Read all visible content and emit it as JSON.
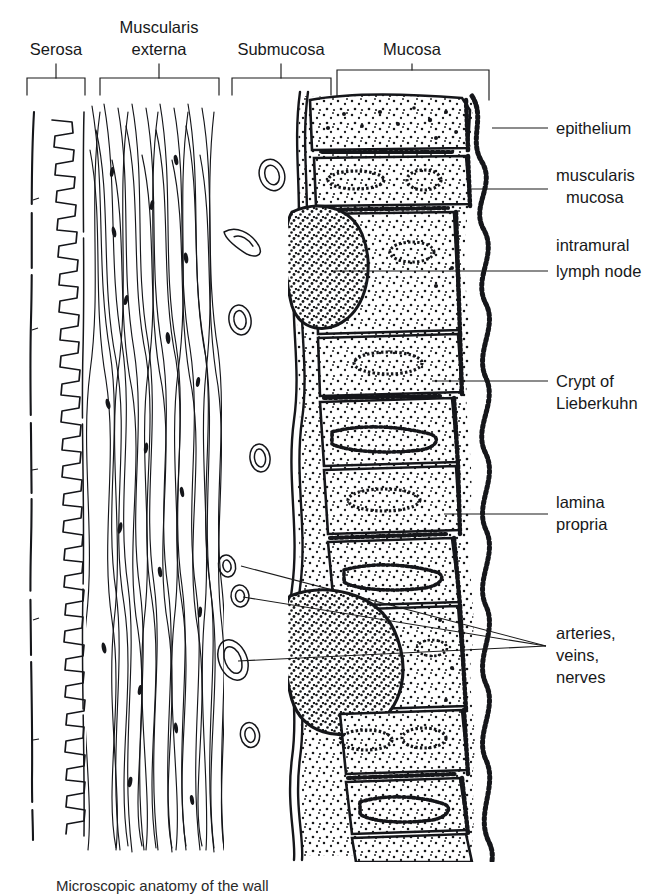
{
  "figure": {
    "background_color": "#ffffff",
    "ink_color": "#15161a",
    "width": 670,
    "height": 896
  },
  "top_brackets": [
    {
      "id": "serosa",
      "label": "Serosa",
      "label_lines": [
        "Serosa"
      ],
      "x_start": 27,
      "x_end": 85,
      "tick_x": 56,
      "bracket_y": 95,
      "stem_top_y": 68,
      "label_x": 56,
      "label_y": 55
    },
    {
      "id": "muscularis-externa",
      "label": "Muscularis externa",
      "label_lines": [
        "Muscularis",
        "externa"
      ],
      "x_start": 100,
      "x_end": 219,
      "tick_x": 159,
      "bracket_y": 95,
      "stem_top_y": 68,
      "label_x": 159,
      "label_y": 34
    },
    {
      "id": "submucosa",
      "label": "Submucosa",
      "label_lines": [
        "Submucosa"
      ],
      "x_start": 232,
      "x_end": 331,
      "tick_x": 281,
      "bracket_y": 95,
      "stem_top_y": 68,
      "label_x": 281,
      "label_y": 55
    },
    {
      "id": "mucosa",
      "label": "Mucosa",
      "label_lines": [
        "Mucosa"
      ],
      "x_start": 336,
      "x_end": 489,
      "tick_x": 412,
      "bracket_y": 82,
      "stem_top_y": 68,
      "label_x": 412,
      "label_y": 55
    }
  ],
  "side_labels": [
    {
      "id": "epithelium",
      "lines": [
        "epithelium"
      ],
      "text_x": 556,
      "first_line_y": 134,
      "line_height": 22,
      "leader": {
        "x1": 492,
        "y1": 128,
        "x2": 548,
        "y2": 128
      }
    },
    {
      "id": "muscularis-mucosa",
      "lines": [
        "muscularis",
        "mucosa"
      ],
      "text_x": 556,
      "first_line_y": 181,
      "line_height": 22,
      "leader": {
        "x1": 470,
        "y1": 189,
        "x2": 548,
        "y2": 189
      }
    },
    {
      "id": "intramural-lymph-node",
      "lines": [
        "intramural",
        "lymph node"
      ],
      "text_x": 556,
      "first_line_y": 251,
      "line_height": 22,
      "leader": {
        "x1": 332,
        "y1": 271,
        "x2": 548,
        "y2": 271
      }
    },
    {
      "id": "crypt-of-lieberkuhn",
      "lines": [
        "Crypt of",
        "Lieberkuhn"
      ],
      "text_x": 556,
      "first_line_y": 381,
      "line_height": 22,
      "leader": {
        "x1": 432,
        "y1": 381,
        "x2": 548,
        "y2": 381
      }
    },
    {
      "id": "lamina-propria",
      "lines": [
        "lamina",
        "propria"
      ],
      "text_x": 556,
      "first_line_y": 505,
      "line_height": 22,
      "leader": {
        "x1": 444,
        "y1": 514,
        "x2": 548,
        "y2": 514
      }
    },
    {
      "id": "arteries-veins-nerves",
      "lines": [
        "arteries,",
        "veins,",
        "nerves"
      ],
      "text_x": 556,
      "first_line_y": 633,
      "line_height": 22,
      "leader": null,
      "converge_point": {
        "x": 546,
        "y": 646
      },
      "leader_origins": [
        {
          "x": 241,
          "y": 566
        },
        {
          "x": 243,
          "y": 597
        },
        {
          "x": 238,
          "y": 661
        }
      ]
    }
  ],
  "caption": {
    "text": "Microscopic anatomy of the wall",
    "x": 56,
    "y": 888,
    "visible": "partial"
  },
  "layers": {
    "serosa": {
      "x_start": 27,
      "x_end": 88,
      "y_start": 104,
      "y_end": 840,
      "pattern": "wavy-squiggle"
    },
    "muscularis_externa": {
      "x_start": 88,
      "x_end": 222,
      "y_start": 104,
      "y_end": 850,
      "pattern": "long-muscle-fibers"
    },
    "submucosa": {
      "x_start": 222,
      "x_end": 290,
      "y_start": 104,
      "y_end": 850,
      "pattern": "open-with-vessels"
    },
    "mucosa": {
      "x_start": 290,
      "x_end": 500,
      "y_start": 88,
      "y_end": 858,
      "pattern": "stippled-villi-crypts"
    }
  },
  "vessels": [
    {
      "id": "vessel-1",
      "cx": 272,
      "cy": 175,
      "rx": 11,
      "ry": 15,
      "rot": -18,
      "shape": "oval-ring"
    },
    {
      "id": "vessel-2",
      "cx": 243,
      "cy": 238,
      "rx": 8,
      "ry": 20,
      "rot": -35,
      "shape": "elongated-ring"
    },
    {
      "id": "vessel-3",
      "cx": 240,
      "cy": 320,
      "rx": 10,
      "ry": 14,
      "rot": -10,
      "shape": "oval-ring"
    },
    {
      "id": "vessel-4",
      "cx": 260,
      "cy": 458,
      "rx": 9,
      "ry": 13,
      "rot": -8,
      "shape": "oval-ring"
    },
    {
      "id": "vessel-5",
      "cx": 227,
      "cy": 566,
      "rx": 8,
      "ry": 11,
      "rot": -12,
      "shape": "oval-ring"
    },
    {
      "id": "vessel-6",
      "cx": 240,
      "cy": 596,
      "rx": 9,
      "ry": 11,
      "rot": -5,
      "shape": "oval-ring"
    },
    {
      "id": "vessel-7",
      "cx": 233,
      "cy": 660,
      "rx": 12,
      "ry": 19,
      "rot": -22,
      "shape": "large-oval-ring"
    },
    {
      "id": "vessel-8",
      "cx": 250,
      "cy": 735,
      "rx": 9,
      "ry": 12,
      "rot": -10,
      "shape": "oval-ring"
    }
  ],
  "lymph_nodes": [
    {
      "id": "lymph-node-upper",
      "cx": 325,
      "cy": 262,
      "rx": 38,
      "ry": 54,
      "label_ref": "intramural-lymph-node"
    },
    {
      "id": "lymph-node-lower",
      "cx": 340,
      "cy": 648,
      "rx": 52,
      "ry": 62,
      "label_ref": "intramural-lymph-node"
    }
  ]
}
